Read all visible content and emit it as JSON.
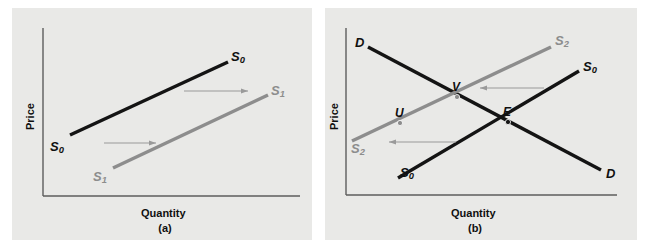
{
  "figure": {
    "background": "#ffffff",
    "panel_background": "#e9e9e7",
    "colors": {
      "curve_black": "#141414",
      "curve_gray": "#8d8d8d",
      "axis": "#5d5d5d",
      "arrow": "#9a9a9a"
    }
  },
  "chart_data": {
    "type": "line",
    "title": "",
    "panels": [
      {
        "id": "a",
        "caption": "(a)",
        "xlabel": "Quantity",
        "ylabel": "Price",
        "description": "Supply curve shifts right from S0 to S1",
        "axes": {
          "origin": [
            43,
            196
          ],
          "x_end": [
            300,
            196
          ],
          "y_top": [
            43,
            28
          ]
        },
        "series": [
          {
            "name": "S0",
            "label": "S₀",
            "color": "#141414",
            "width": 3.4,
            "points": [
              [
                70,
                135
              ],
              [
                228,
                62
              ]
            ],
            "labels": [
              {
                "text": "S",
                "sub": "0",
                "x": 50,
                "y": 140,
                "color": "#141414"
              },
              {
                "text": "S",
                "sub": "0",
                "x": 231,
                "y": 50,
                "color": "#141414"
              }
            ]
          },
          {
            "name": "S1",
            "label": "S₁",
            "color": "#8d8d8d",
            "width": 3.4,
            "points": [
              [
                113,
                168
              ],
              [
                268,
                95
              ]
            ],
            "labels": [
              {
                "text": "S",
                "sub": "1",
                "x": 93,
                "y": 170,
                "color": "#8d8d8d"
              },
              {
                "text": "S",
                "sub": "1",
                "x": 271,
                "y": 84,
                "color": "#8d8d8d"
              }
            ]
          }
        ],
        "arrows": [
          {
            "name": "shift-arrow-lower",
            "x1": 104,
            "y1": 143,
            "x2": 156,
            "y2": 143,
            "direction": "right"
          },
          {
            "name": "shift-arrow-upper",
            "x1": 184,
            "y1": 91,
            "x2": 248,
            "y2": 91,
            "direction": "right"
          }
        ],
        "points": []
      },
      {
        "id": "b",
        "caption": "(b)",
        "xlabel": "Quantity",
        "ylabel": "Price",
        "description": "Supply curve shifts left from S0 to S2, equilibrium moves from E to V",
        "axes": {
          "origin": [
            346,
            195
          ],
          "x_end": [
            617,
            195
          ],
          "y_top": [
            346,
            28
          ]
        },
        "series": [
          {
            "name": "D",
            "label": "D",
            "color": "#141414",
            "width": 3.4,
            "points": [
              [
                368,
                47
              ],
              [
                601,
                170
              ]
            ],
            "labels": [
              {
                "text": "D",
                "sub": "",
                "x": 355,
                "y": 36,
                "color": "#141414"
              },
              {
                "text": "D",
                "sub": "",
                "x": 606,
                "y": 167,
                "color": "#141414"
              }
            ]
          },
          {
            "name": "S0",
            "label": "S₀",
            "color": "#141414",
            "width": 3.4,
            "points": [
              [
                398,
                178
              ],
              [
                579,
                71
              ]
            ],
            "labels": [
              {
                "text": "S",
                "sub": "0",
                "x": 400,
                "y": 166,
                "color": "#141414"
              },
              {
                "text": "S",
                "sub": "0",
                "x": 583,
                "y": 60,
                "color": "#141414"
              }
            ]
          },
          {
            "name": "S2",
            "label": "S₂",
            "color": "#8d8d8d",
            "width": 3.4,
            "points": [
              [
                352,
                141
              ],
              [
                551,
                47
              ]
            ],
            "labels": [
              {
                "text": "S",
                "sub": "2",
                "x": 351,
                "y": 142,
                "color": "#8d8d8d"
              },
              {
                "text": "S",
                "sub": "2",
                "x": 555,
                "y": 34,
                "color": "#8d8d8d"
              }
            ]
          }
        ],
        "arrows": [
          {
            "name": "shift-arrow-upper",
            "x1": 544,
            "y1": 88,
            "x2": 480,
            "y2": 88,
            "direction": "left"
          },
          {
            "name": "shift-arrow-lower",
            "x1": 456,
            "y1": 142,
            "x2": 389,
            "y2": 142,
            "direction": "left"
          }
        ],
        "points": [
          {
            "name": "point-U",
            "label": "U",
            "x": 400,
            "y": 123,
            "color": "#8d8d8d",
            "label_x": 395,
            "label_y": 107
          },
          {
            "name": "point-V",
            "label": "V",
            "x": 457,
            "y": 97,
            "color": "#8d8d8d",
            "label_x": 452,
            "label_y": 81
          },
          {
            "name": "point-E",
            "label": "E",
            "x": 508,
            "y": 122,
            "color": "#141414",
            "label_x": 503,
            "label_y": 106
          }
        ]
      }
    ]
  }
}
